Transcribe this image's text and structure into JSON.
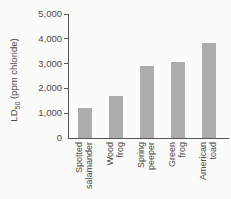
{
  "chart_data": {
    "type": "bar",
    "title": "",
    "xlabel": "",
    "ylabel": "LD50 (ppm chloride)",
    "ylabel_parts": {
      "pre": "LD",
      "sub": "50",
      "post": " (ppm chloride)"
    },
    "categories": [
      [
        "Spotted",
        "salamander"
      ],
      [
        "Wood",
        "frog"
      ],
      [
        "Spring",
        "peeper"
      ],
      [
        "Green",
        "frog"
      ],
      [
        "American",
        "toad"
      ]
    ],
    "values": [
      1200,
      1700,
      2900,
      3050,
      3850
    ],
    "ylim": [
      0,
      5000
    ],
    "yticks": [
      {
        "label": "0",
        "value": 0
      },
      {
        "label": "1,000",
        "value": 1000
      },
      {
        "label": "2,000",
        "value": 2000
      },
      {
        "label": "3,000",
        "value": 3000
      },
      {
        "label": "4,000",
        "value": 4000
      },
      {
        "label": "5,000",
        "value": 5000
      }
    ],
    "grid": false,
    "legend": null,
    "colors": {
      "bar": "#aeacaa",
      "axis": "#56565a",
      "text": "#4b4b4d",
      "background": "#fbfbf9"
    }
  }
}
